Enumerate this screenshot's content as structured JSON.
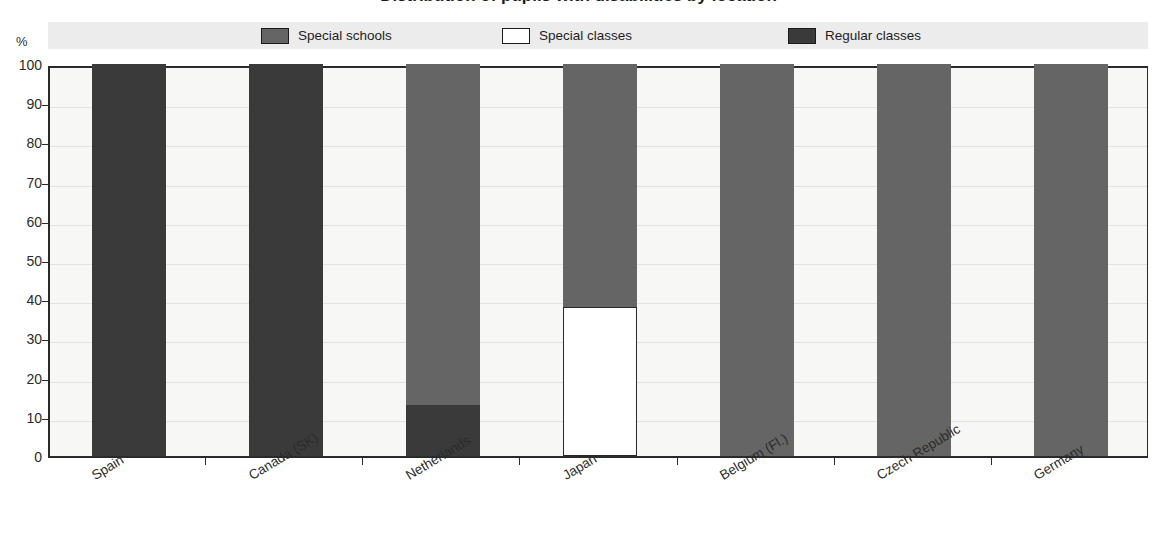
{
  "title": "Distribution of pupils with disabilities by location",
  "unit_label": "%",
  "legend": {
    "items": [
      {
        "label": "Special schools",
        "color": "#656565",
        "swatch": "legend-swatch-special-schools"
      },
      {
        "label": "Special classes",
        "color": "#ffffff",
        "swatch": "legend-swatch-special-classes"
      },
      {
        "label": "Regular classes",
        "color": "#3a3a3a",
        "swatch": "legend-swatch-regular-classes"
      }
    ]
  },
  "colors": {
    "special_schools": "#656565",
    "special_classes": "#ffffff",
    "regular_classes": "#3a3a3a",
    "axis": "#2a2a2a",
    "plot_background": "#f7f7f5",
    "legend_background": "#ececed"
  },
  "axes": {
    "y_ticks": [
      "100",
      "90",
      "80",
      "70",
      "60",
      "50",
      "40",
      "30",
      "20",
      "10",
      "0"
    ],
    "y_unit": "%",
    "y_min": 0,
    "y_max": 100
  },
  "chart_data": {
    "type": "bar",
    "stacked": true,
    "title": "Distribution of pupils with disabilities by location",
    "xlabel": "",
    "ylabel": "%",
    "ylim": [
      0,
      100
    ],
    "grid": true,
    "legend_position": "top",
    "categories": [
      "Spain",
      "Canada (SK)",
      "Netherlands",
      "Japan",
      "Belgium (Fl.)",
      "Czech Republic",
      "Germany"
    ],
    "series": [
      {
        "name": "Special schools",
        "color": "#656565",
        "values": [
          0,
          0,
          87,
          62,
          100,
          100,
          100
        ]
      },
      {
        "name": "Special classes",
        "color": "#ffffff",
        "values": [
          0,
          0,
          0,
          38,
          0,
          0,
          0
        ]
      },
      {
        "name": "Regular classes",
        "color": "#3a3a3a",
        "values": [
          100,
          100,
          13,
          0,
          0,
          0,
          0
        ]
      }
    ]
  }
}
